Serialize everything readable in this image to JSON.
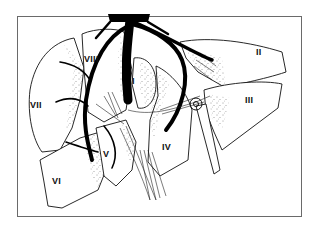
{
  "diagram": {
    "type": "anatomical-illustration",
    "frame": {
      "x": 17,
      "y": 16,
      "width": 285,
      "height": 201,
      "border_color": "#6a6a6a"
    },
    "segments": [
      {
        "id": "I",
        "label": "I",
        "x": 142,
        "y": 81
      },
      {
        "id": "II",
        "label": "II",
        "x": 259,
        "y": 52
      },
      {
        "id": "III",
        "label": "III",
        "x": 250,
        "y": 100
      },
      {
        "id": "IV",
        "label": "IV",
        "x": 167,
        "y": 147
      },
      {
        "id": "V",
        "label": "V",
        "x": 106,
        "y": 154
      },
      {
        "id": "VI",
        "label": "VI",
        "x": 57,
        "y": 181
      },
      {
        "id": "VII",
        "label": "VII",
        "x": 33,
        "y": 105
      },
      {
        "id": "VIII",
        "label": "VIII",
        "x": 86,
        "y": 59
      }
    ],
    "colors": {
      "ink": "#000000",
      "background": "#ffffff",
      "frame": "#6a6a6a"
    }
  }
}
